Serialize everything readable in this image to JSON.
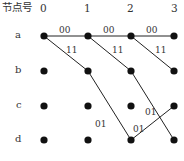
{
  "header": {
    "node_label": "节点号",
    "columns": [
      "0",
      "1",
      "2",
      "3"
    ]
  },
  "rows": [
    "a",
    "b",
    "c",
    "d"
  ],
  "colors": {
    "ink": "#111111",
    "text": "#333333"
  },
  "nodes": [
    {
      "id": "a0",
      "x": 44,
      "y": 36
    },
    {
      "id": "a1",
      "x": 88,
      "y": 36
    },
    {
      "id": "a2",
      "x": 131,
      "y": 36
    },
    {
      "id": "a3",
      "x": 174,
      "y": 36
    },
    {
      "id": "b0",
      "x": 44,
      "y": 71
    },
    {
      "id": "b1",
      "x": 88,
      "y": 71
    },
    {
      "id": "b2",
      "x": 131,
      "y": 71
    },
    {
      "id": "b3",
      "x": 174,
      "y": 71
    },
    {
      "id": "c0",
      "x": 44,
      "y": 106
    },
    {
      "id": "c1",
      "x": 88,
      "y": 106
    },
    {
      "id": "c2",
      "x": 131,
      "y": 106
    },
    {
      "id": "c3",
      "x": 174,
      "y": 106
    },
    {
      "id": "d0",
      "x": 44,
      "y": 140
    },
    {
      "id": "d1",
      "x": 88,
      "y": 140
    },
    {
      "id": "d2",
      "x": 131,
      "y": 140
    },
    {
      "id": "d3",
      "x": 174,
      "y": 140
    }
  ],
  "edges": [
    {
      "from": "a0",
      "to": "a1",
      "label": "00"
    },
    {
      "from": "a1",
      "to": "a2",
      "label": "00"
    },
    {
      "from": "a2",
      "to": "a3",
      "label": "00"
    },
    {
      "from": "a0",
      "to": "b1",
      "label": "11"
    },
    {
      "from": "a1",
      "to": "b2",
      "label": "11"
    },
    {
      "from": "a2",
      "to": "b3",
      "label": "11"
    },
    {
      "from": "b1",
      "to": "d2",
      "label": "01"
    },
    {
      "from": "b2",
      "to": "d3",
      "label": "01"
    },
    {
      "from": "d2",
      "to": "c3",
      "label": "01"
    }
  ],
  "edge_labels": {
    "e0": "00",
    "e1": "00",
    "e2": "00",
    "e3": "11",
    "e4": "11",
    "e5": "11",
    "e6": "01",
    "e7": "01",
    "e8": "01"
  }
}
